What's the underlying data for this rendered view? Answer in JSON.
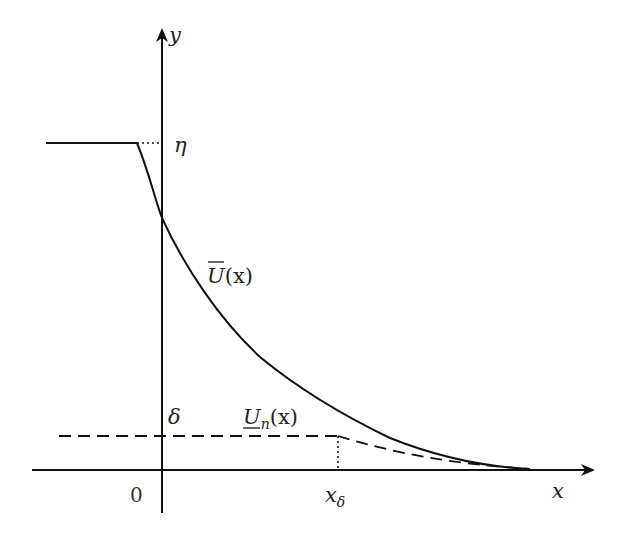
{
  "diagram": {
    "axes": {
      "x_label": "x",
      "y_label": "y",
      "origin_label": "0"
    },
    "levels": {
      "eta_label": "η",
      "delta_label": "δ"
    },
    "curves": {
      "upper": {
        "name": "U",
        "arg": "(x)",
        "style": "solid",
        "decoration": "overline"
      },
      "lower": {
        "name": "U",
        "sub": "n",
        "arg": "(x)",
        "style": "dashed",
        "decoration": "underline"
      }
    },
    "marks": {
      "x_delta_main": "x",
      "x_delta_sub": "δ"
    },
    "colors": {
      "stroke": "#111111",
      "background": "#ffffff"
    }
  }
}
